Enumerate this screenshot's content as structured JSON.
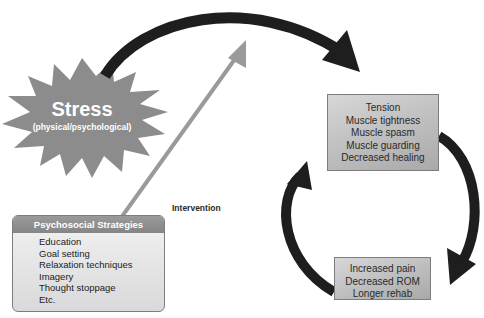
{
  "diagram": {
    "stressor": {
      "title": "Stress",
      "subtitle": "(physical/psychological)",
      "shape": "starburst",
      "color": "#8c8c8c"
    },
    "intervention_label": "Intervention",
    "strategies": {
      "header": "Psychosocial Strategies",
      "items": [
        "Education",
        "Goal setting",
        "Relaxation techniques",
        "Imagery",
        "Thought stoppage",
        "Etc."
      ]
    },
    "effects_box": {
      "items": [
        "Tension",
        "Muscle tightness",
        "Muscle spasm",
        "Muscle guarding",
        "Decreased healing"
      ]
    },
    "outcomes_box": {
      "items": [
        "Increased pain",
        "Decreased ROM",
        "Longer rehab"
      ]
    },
    "colors": {
      "arrow_dark": "#1e1e1e",
      "arrow_intervention": "#9a9a9a",
      "box_fill": "#c0c0c0",
      "header_fill": "#8f8f8f"
    }
  }
}
